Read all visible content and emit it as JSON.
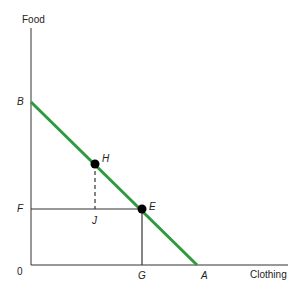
{
  "diagram": {
    "y_axis_label": "Food",
    "x_axis_label": "Clothing",
    "origin_label": "0",
    "points": {
      "B": "B",
      "A": "A",
      "H": "H",
      "E": "E",
      "F": "F",
      "J": "J",
      "G": "G"
    },
    "colors": {
      "budget_line": "#2e9a3e",
      "axes": "#333333",
      "points": "#000000"
    }
  }
}
